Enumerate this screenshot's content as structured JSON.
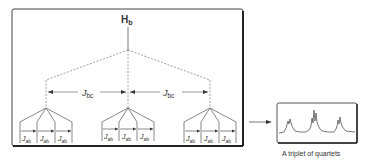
{
  "diagram": {
    "root_label": "H",
    "root_sub": "b",
    "coupling_bc": {
      "main": "J",
      "sub": "bc"
    },
    "coupling_ab": {
      "main": "J",
      "sub": "ab"
    },
    "caption": "A triplet of quartets",
    "colors": {
      "line": "#555555",
      "box": "#333333",
      "dash": "#888888"
    }
  }
}
